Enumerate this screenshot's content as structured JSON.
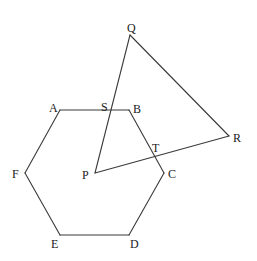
{
  "figure": {
    "hexagon": {
      "name": "hexagon-ABCDEF",
      "vertices": [
        "A",
        "B",
        "C",
        "D",
        "E",
        "F"
      ]
    },
    "triangle": {
      "name": "triangle-PQR",
      "vertices": [
        "P",
        "Q",
        "R"
      ]
    },
    "intersections": [
      {
        "label": "S",
        "segments": [
          "PQ",
          "AB"
        ]
      },
      {
        "label": "T",
        "segments": [
          "PR",
          "BC"
        ]
      }
    ],
    "labels": {
      "A": "A",
      "B": "B",
      "C": "C",
      "D": "D",
      "E": "E",
      "F": "F",
      "P": "P",
      "Q": "Q",
      "R": "R",
      "S": "S",
      "T": "T"
    }
  }
}
